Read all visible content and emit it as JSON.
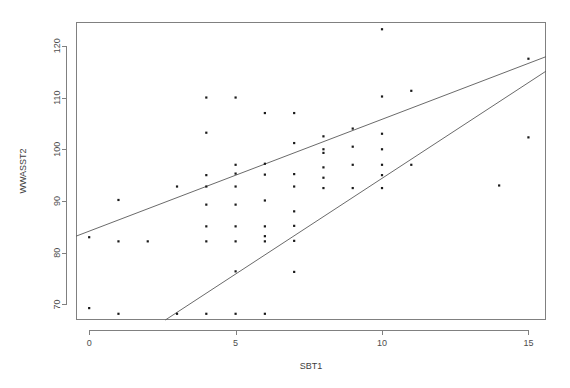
{
  "chart_data": {
    "type": "scatter",
    "title": "",
    "xlabel": "SBT1",
    "ylabel": "WWASST2",
    "xlim": [
      -0.45,
      15.6
    ],
    "ylim": [
      67.0,
      124.6
    ],
    "xticks": [
      0,
      5,
      10,
      15
    ],
    "xtick_labels": [
      "0",
      "5",
      "10",
      "15"
    ],
    "yticks": [
      70,
      80,
      90,
      100,
      110,
      120
    ],
    "ytick_labels": [
      "70",
      "80",
      "90",
      "100",
      "110",
      "120"
    ],
    "grid": false,
    "legend": null,
    "point_color": "#1a1a1a",
    "line_color": "#595959",
    "axis_color": "#808080",
    "points": [
      {
        "x": 0,
        "y": 69.3
      },
      {
        "x": 0,
        "y": 83.0
      },
      {
        "x": 1,
        "y": 68.2
      },
      {
        "x": 1,
        "y": 82.2
      },
      {
        "x": 1,
        "y": 90.2
      },
      {
        "x": 2,
        "y": 82.2
      },
      {
        "x": 3,
        "y": 68.2
      },
      {
        "x": 3,
        "y": 92.8
      },
      {
        "x": 4,
        "y": 68.2
      },
      {
        "x": 4,
        "y": 82.2
      },
      {
        "x": 4,
        "y": 85.1
      },
      {
        "x": 4,
        "y": 89.3
      },
      {
        "x": 4,
        "y": 92.8
      },
      {
        "x": 4,
        "y": 95.0
      },
      {
        "x": 4,
        "y": 103.2
      },
      {
        "x": 4,
        "y": 110.0
      },
      {
        "x": 5,
        "y": 68.2
      },
      {
        "x": 5,
        "y": 76.4
      },
      {
        "x": 5,
        "y": 82.2
      },
      {
        "x": 5,
        "y": 85.1
      },
      {
        "x": 5,
        "y": 89.3
      },
      {
        "x": 5,
        "y": 92.8
      },
      {
        "x": 5,
        "y": 95.3
      },
      {
        "x": 5,
        "y": 97.0
      },
      {
        "x": 5,
        "y": 110.0
      },
      {
        "x": 6,
        "y": 68.2
      },
      {
        "x": 6,
        "y": 82.2
      },
      {
        "x": 6,
        "y": 83.2
      },
      {
        "x": 6,
        "y": 85.1
      },
      {
        "x": 6,
        "y": 90.1
      },
      {
        "x": 6,
        "y": 95.1
      },
      {
        "x": 6,
        "y": 97.2
      },
      {
        "x": 6,
        "y": 107.0
      },
      {
        "x": 7,
        "y": 76.3
      },
      {
        "x": 7,
        "y": 82.3
      },
      {
        "x": 7,
        "y": 85.2
      },
      {
        "x": 7,
        "y": 88.0
      },
      {
        "x": 7,
        "y": 92.8
      },
      {
        "x": 7,
        "y": 95.2
      },
      {
        "x": 7,
        "y": 101.2
      },
      {
        "x": 7,
        "y": 107.0
      },
      {
        "x": 8,
        "y": 92.5
      },
      {
        "x": 8,
        "y": 94.5
      },
      {
        "x": 8,
        "y": 96.5
      },
      {
        "x": 8,
        "y": 99.3
      },
      {
        "x": 8,
        "y": 100.0
      },
      {
        "x": 8,
        "y": 102.5
      },
      {
        "x": 9,
        "y": 92.5
      },
      {
        "x": 9,
        "y": 97.0
      },
      {
        "x": 9,
        "y": 100.5
      },
      {
        "x": 9,
        "y": 104.0
      },
      {
        "x": 10,
        "y": 92.5
      },
      {
        "x": 10,
        "y": 95.0
      },
      {
        "x": 10,
        "y": 97.0
      },
      {
        "x": 10,
        "y": 100.0
      },
      {
        "x": 10,
        "y": 103.0
      },
      {
        "x": 10,
        "y": 110.2
      },
      {
        "x": 10,
        "y": 123.2
      },
      {
        "x": 11,
        "y": 97.0
      },
      {
        "x": 11,
        "y": 111.3
      },
      {
        "x": 14,
        "y": 93.0
      },
      {
        "x": 15,
        "y": 102.3
      },
      {
        "x": 15,
        "y": 117.5
      }
    ],
    "lines": [
      {
        "name": "upper-fit-line",
        "x_start": -0.45,
        "y_start": 83.2,
        "x_end": 15.6,
        "y_end": 117.9
      },
      {
        "name": "lower-fit-line",
        "x_start": 2.6,
        "y_start": 67.0,
        "x_end": 15.6,
        "y_end": 115.1
      }
    ]
  }
}
